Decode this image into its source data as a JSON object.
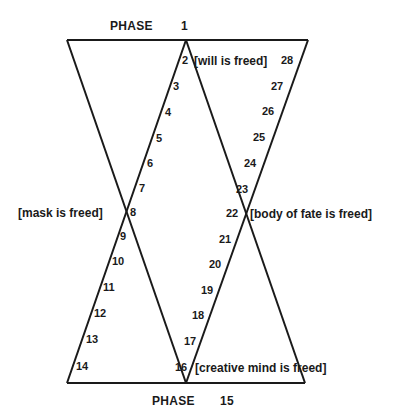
{
  "diagram": {
    "title_top": {
      "label": "PHASE",
      "number": "1"
    },
    "title_bottom": {
      "label": "PHASE",
      "number": "15"
    },
    "annotations": {
      "will": "[will is freed]",
      "mask": "[mask is freed]",
      "body_of_fate": "[body of fate is freed]",
      "creative_mind": "[creative mind is freed]"
    },
    "phases": {
      "p2": "2",
      "p3": "3",
      "p4": "4",
      "p5": "5",
      "p6": "6",
      "p7": "7",
      "p8": "8",
      "p9": "9",
      "p10": "10",
      "p11": "11",
      "p12": "12",
      "p13": "13",
      "p14": "14",
      "p16": "16",
      "p17": "17",
      "p18": "18",
      "p19": "19",
      "p20": "20",
      "p21": "21",
      "p22": "22",
      "p23": "23",
      "p24": "24",
      "p25": "25",
      "p26": "26",
      "p27": "27",
      "p28": "28"
    },
    "line_color": "#1a1a1a"
  }
}
